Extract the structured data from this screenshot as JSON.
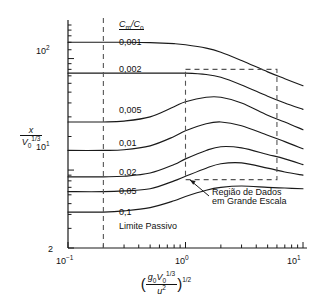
{
  "chart_data": {
    "type": "line",
    "title": "",
    "xlabel": "(g₀V₀^(1/3)/u²)^(1/2)",
    "ylabel": "x/V₀^(1/3)",
    "xscale": "log",
    "yscale": "log",
    "xlim": [
      0.1,
      10
    ],
    "ylim": [
      2,
      200
    ],
    "xticks": [
      "10⁻¹",
      "10⁰",
      "10¹"
    ],
    "xtick_values": [
      0.1,
      1,
      10
    ],
    "yticks": [
      "2",
      "10¹",
      "10²"
    ],
    "ytick_values": [
      2,
      10,
      100
    ],
    "grid": false,
    "legend_title": "Cm/Co",
    "series": [
      {
        "name": "0,001",
        "x": [
          0.1,
          0.2,
          0.3,
          0.5,
          0.8,
          1.0,
          1.5,
          2.0,
          3.0,
          5.0,
          7.0,
          10.0
        ],
        "y": [
          140,
          140,
          140,
          139,
          136,
          133,
          124,
          114,
          96,
          76,
          66,
          57
        ]
      },
      {
        "name": "0,002",
        "x": [
          0.1,
          0.2,
          0.3,
          0.5,
          0.8,
          1.0,
          1.5,
          2.0,
          3.0,
          5.0,
          7.0,
          10.0
        ],
        "y": [
          74,
          74,
          74,
          74,
          74,
          74,
          72,
          68,
          58,
          46,
          40,
          35
        ]
      },
      {
        "name": "0,005",
        "x": [
          0.1,
          0.2,
          0.3,
          0.5,
          0.8,
          1.0,
          1.5,
          2.0,
          3.0,
          5.0,
          7.0,
          10.0
        ],
        "y": [
          27,
          27,
          27.5,
          30,
          37,
          41,
          45,
          45,
          40,
          31,
          27,
          23
        ]
      },
      {
        "name": "0,01",
        "x": [
          0.1,
          0.2,
          0.3,
          0.5,
          0.8,
          1.0,
          1.5,
          2.0,
          3.0,
          5.0,
          7.0,
          10.0
        ],
        "y": [
          15,
          15,
          15.2,
          16.5,
          20,
          22.5,
          26,
          27,
          25,
          20.5,
          18,
          15.5
        ]
      },
      {
        "name": "0,02",
        "x": [
          0.1,
          0.2,
          0.3,
          0.5,
          0.8,
          1.0,
          1.5,
          2.0,
          3.0,
          5.0,
          7.0,
          10.0
        ],
        "y": [
          8.7,
          8.7,
          8.8,
          9.4,
          11.2,
          12.6,
          15.0,
          16.2,
          15.8,
          13.8,
          12.6,
          11.2
        ]
      },
      {
        "name": "0,05",
        "x": [
          0.1,
          0.2,
          0.3,
          0.5,
          0.8,
          1.0,
          1.5,
          2.0,
          3.0,
          5.0,
          7.0,
          10.0
        ],
        "y": [
          6.4,
          6.4,
          6.5,
          6.8,
          8.0,
          8.8,
          10.4,
          11.4,
          11.6,
          10.4,
          9.6,
          9.0
        ]
      },
      {
        "name": "0,1",
        "x": [
          0.1,
          0.2,
          0.3,
          0.5,
          0.8,
          1.0,
          1.5,
          2.0,
          3.0,
          5.0,
          7.0,
          10.0
        ],
        "y": [
          4.2,
          4.2,
          4.3,
          4.6,
          5.3,
          5.8,
          6.6,
          7.0,
          7.2,
          7.0,
          6.9,
          6.8
        ]
      }
    ],
    "annotations": [
      {
        "name": "passive-limit",
        "text": "Limite Passivo",
        "type": "vertical-dashed-line",
        "x": 0.2
      },
      {
        "name": "large-scale-data-region",
        "text": "Região de Dados em Grande Escala",
        "type": "dashed-box",
        "x_range": [
          1.0,
          6.0
        ],
        "y_range": [
          8.2,
          80
        ]
      }
    ]
  },
  "axes": {
    "y_label_num": "x",
    "y_label_den": "V",
    "y_label_den_sub": "0",
    "y_label_den_sup": "1/3",
    "x_label_num_g": "g",
    "x_label_num_g_sub": "0",
    "x_label_num_v": "V",
    "x_label_num_v_sub": "0",
    "x_label_num_v_sup": "1/3",
    "x_label_den_u": "u",
    "x_label_den_sup": "2",
    "x_label_outer_sup": "1/2",
    "ytick_2": "2",
    "ytick_10_base": "10",
    "ytick_10_exp": "1",
    "ytick_100_base": "10",
    "ytick_100_exp": "2",
    "xtick_lo_base": "10",
    "xtick_lo_exp": "−1",
    "xtick_mid_base": "10",
    "xtick_mid_exp": "0",
    "xtick_hi_base": "10",
    "xtick_hi_exp": "1"
  },
  "legend": {
    "title_c": "C",
    "title_m": "m",
    "title_slash": "/C",
    "title_o": "o"
  },
  "curve_labels": [
    "0,001",
    "0,002",
    "0,005",
    "0,01",
    "0,02",
    "0,05",
    "0,1"
  ],
  "notes": {
    "passive_limit": "Limite Passivo",
    "region_line1": "Região de Dados",
    "region_line2": "em Grande Escala"
  },
  "colors": {
    "curve": "#1a1a1a",
    "axis": "#1a1a1a",
    "dashed": "#555555",
    "background": "#ffffff"
  }
}
